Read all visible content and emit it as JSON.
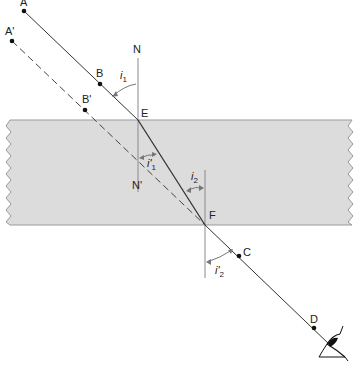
{
  "diagram": {
    "title": "",
    "colors": {
      "slab_fill": "#dcdcdc",
      "slab_edge": "#9a9a9a",
      "ray": "#333333",
      "normal": "#8a8a8a",
      "angle_arrow": "#777777"
    },
    "points": {
      "A": {
        "label": "A",
        "x": 24,
        "y": 11
      },
      "A_prime": {
        "label": "A'",
        "x": 12,
        "y": 41
      },
      "B": {
        "label": "B",
        "x": 100,
        "y": 84
      },
      "B_prime": {
        "label": "B'",
        "x": 85,
        "y": 110
      },
      "E": {
        "label": "E",
        "x": 138,
        "y": 120
      },
      "F": {
        "label": "F",
        "x": 205,
        "y": 225
      },
      "C": {
        "label": "C",
        "x": 239,
        "y": 256
      },
      "D": {
        "label": "D",
        "x": 314,
        "y": 328
      }
    },
    "normals": {
      "N": {
        "label": "N"
      },
      "N_prime": {
        "label": "N'"
      }
    },
    "angles": {
      "i1": {
        "base": "i",
        "sub": "1"
      },
      "i1_prime": {
        "base": "i'",
        "sub": "1"
      },
      "i2": {
        "base": "i",
        "sub": "2"
      },
      "i2_prime": {
        "base": "i'",
        "sub": "2"
      }
    },
    "icons": {
      "observer": "eye-icon"
    }
  }
}
